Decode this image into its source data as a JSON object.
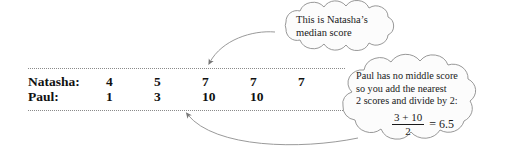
{
  "figure": {
    "type": "median-explanation-diagram",
    "colors": {
      "background": "#ffffff",
      "text": "#111111",
      "rule": "#8a8a8a",
      "cloud_outline": "#8c8c8c",
      "cloud_fill": "#fcfcfc",
      "arrow": "#777777"
    }
  },
  "table": {
    "rows": [
      {
        "name": "Natasha:",
        "values": [
          "4",
          "5",
          "7",
          "7",
          "7"
        ]
      },
      {
        "name": "Paul:",
        "values": [
          "1",
          "3",
          "10",
          "10"
        ]
      }
    ]
  },
  "callouts": {
    "median_cloud": {
      "line1": "This is Natasha’s",
      "line2": "median score"
    },
    "mean_cloud": {
      "line1": "Paul has no middle score",
      "line2": "so you add the nearest",
      "line3": "2 scores and divide by 2:",
      "math": {
        "numerator": "3 + 10",
        "denominator": "2",
        "equals": "= 6.5"
      }
    }
  },
  "annotations": {
    "arrow_to_natasha_median": "curved-arrow-pointing-to-natasha-middle-score",
    "arrow_to_paul_middle": "curved-arrow-pointing-to-paul-middle-pair"
  }
}
